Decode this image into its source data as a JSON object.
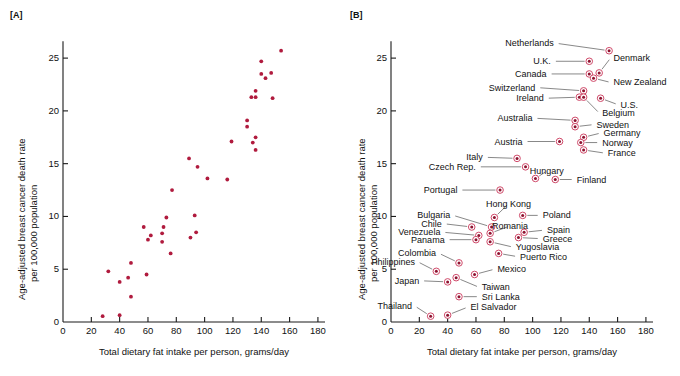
{
  "figure": {
    "background": "#ffffff",
    "marker_color": "#b01b3e",
    "ring_color": "#d04a6a",
    "leader_color": "#555555"
  },
  "panels": [
    {
      "tag": "[A]",
      "id": "panel-a",
      "xlabel": "Total dietary fat intake per person, grams/day",
      "ylabel_line1": "Age-adjusted breast cancer death rate",
      "ylabel_line2": "per 100,000 population",
      "xticks": [
        "0",
        "20",
        "40",
        "60",
        "80",
        "100",
        "120",
        "140",
        "160",
        "180"
      ],
      "yticks": [
        "0",
        "5",
        "10",
        "15",
        "20",
        "25"
      ]
    },
    {
      "tag": "[B]",
      "id": "panel-b",
      "xlabel": "Total dietary fat intake per person, grams/day",
      "ylabel_line1": "Age-adjusted breast cancer death rate",
      "ylabel_line2": "per 100,000 population",
      "xticks": [
        "0",
        "20",
        "40",
        "60",
        "80",
        "100",
        "120",
        "140",
        "160",
        "180"
      ],
      "yticks": [
        "0",
        "5",
        "10",
        "15",
        "20",
        "25"
      ]
    }
  ],
  "chart_data": {
    "type": "scatter",
    "title": "",
    "subtitle": "",
    "xlabel": "Total dietary fat intake per person, grams/day",
    "ylabel": "Age-adjusted breast cancer death rate per 100,000 population",
    "xlim": [
      0,
      185
    ],
    "ylim": [
      0,
      27
    ],
    "xticks": [
      0,
      20,
      40,
      60,
      80,
      100,
      120,
      140,
      160,
      180
    ],
    "yticks": [
      0,
      5,
      10,
      15,
      20,
      25
    ],
    "grid": false,
    "legend": "none",
    "panel_a_note": "Same data as panel B, plotted without country labels",
    "panel_b_note": "Same data as panel A, with country name labels and leader lines",
    "points": [
      {
        "label": "Netherlands",
        "x": 154,
        "y": 25.7,
        "lx": 117,
        "ly": 26.4,
        "anchor": "right"
      },
      {
        "label": "Denmark",
        "x": 147,
        "y": 23.6,
        "lx": 155,
        "ly": 25.0,
        "anchor": "left"
      },
      {
        "label": "U.K.",
        "x": 140,
        "y": 24.7,
        "lx": 115,
        "ly": 24.7,
        "anchor": "right"
      },
      {
        "label": "Canada",
        "x": 140,
        "y": 23.5,
        "lx": 112,
        "ly": 23.5,
        "anchor": "right"
      },
      {
        "label": "New Zealand",
        "x": 143,
        "y": 23.1,
        "lx": 155,
        "ly": 22.7,
        "anchor": "left"
      },
      {
        "label": "Switzerland",
        "x": 136,
        "y": 21.9,
        "lx": 104,
        "ly": 22.2,
        "anchor": "right"
      },
      {
        "label": "Ireland",
        "x": 133,
        "y": 21.3,
        "lx": 110,
        "ly": 21.2,
        "anchor": "right"
      },
      {
        "label": "U.S.",
        "x": 148,
        "y": 21.2,
        "lx": 160,
        "ly": 20.6,
        "anchor": "left"
      },
      {
        "label": "Belgium",
        "x": 136,
        "y": 21.3,
        "lx": 147,
        "ly": 19.8,
        "anchor": "left"
      },
      {
        "label": "Australia",
        "x": 130,
        "y": 19.1,
        "lx": 102,
        "ly": 19.3,
        "anchor": "right"
      },
      {
        "label": "Sweden",
        "x": 130,
        "y": 18.5,
        "lx": 143,
        "ly": 18.7,
        "anchor": "left"
      },
      {
        "label": "Germany",
        "x": 136,
        "y": 17.5,
        "lx": 148,
        "ly": 17.9,
        "anchor": "left"
      },
      {
        "label": "Norway",
        "x": 134,
        "y": 17.0,
        "lx": 147,
        "ly": 17.0,
        "anchor": "left"
      },
      {
        "label": "Austria",
        "x": 119,
        "y": 17.1,
        "lx": 95,
        "ly": 17.1,
        "anchor": "right"
      },
      {
        "label": "France",
        "x": 136,
        "y": 16.3,
        "lx": 151,
        "ly": 16.0,
        "anchor": "left"
      },
      {
        "label": "Italy",
        "x": 89,
        "y": 15.5,
        "lx": 67,
        "ly": 15.6,
        "anchor": "right"
      },
      {
        "label": "Czech Rep.",
        "x": 95,
        "y": 14.7,
        "lx": 62,
        "ly": 14.7,
        "anchor": "right"
      },
      {
        "label": "Hungary",
        "x": 102,
        "y": 13.6,
        "lx": 110,
        "ly": 14.3,
        "anchor": "center"
      },
      {
        "label": "Finland",
        "x": 116,
        "y": 13.5,
        "lx": 129,
        "ly": 13.5,
        "anchor": "left"
      },
      {
        "label": "Portugal",
        "x": 77,
        "y": 12.5,
        "lx": 49,
        "ly": 12.5,
        "anchor": "right"
      },
      {
        "label": "Hong Kong",
        "x": 73,
        "y": 9.9,
        "lx": 83,
        "ly": 11.2,
        "anchor": "center"
      },
      {
        "label": "Poland",
        "x": 93,
        "y": 10.1,
        "lx": 105,
        "ly": 10.1,
        "anchor": "left"
      },
      {
        "label": "Bulgaria",
        "x": 71,
        "y": 9.0,
        "lx": 44,
        "ly": 10.1,
        "anchor": "right"
      },
      {
        "label": "Chile",
        "x": 57,
        "y": 9.0,
        "lx": 38,
        "ly": 9.3,
        "anchor": "right"
      },
      {
        "label": "Romania",
        "x": 70,
        "y": 8.4,
        "lx": 84,
        "ly": 9.1,
        "anchor": "center"
      },
      {
        "label": "Spain",
        "x": 94,
        "y": 8.5,
        "lx": 108,
        "ly": 8.7,
        "anchor": "left"
      },
      {
        "label": "Venezuela",
        "x": 62,
        "y": 8.2,
        "lx": 37,
        "ly": 8.5,
        "anchor": "right"
      },
      {
        "label": "Greece",
        "x": 90,
        "y": 8.0,
        "lx": 105,
        "ly": 7.9,
        "anchor": "left"
      },
      {
        "label": "Panama",
        "x": 60,
        "y": 7.8,
        "lx": 40,
        "ly": 7.8,
        "anchor": "right"
      },
      {
        "label": "Yugoslavia",
        "x": 70,
        "y": 7.6,
        "lx": 86,
        "ly": 7.1,
        "anchor": "left"
      },
      {
        "label": "Colombia",
        "x": 48,
        "y": 5.6,
        "lx": 34,
        "ly": 6.5,
        "anchor": "right"
      },
      {
        "label": "Puerto Rico",
        "x": 76,
        "y": 6.5,
        "lx": 89,
        "ly": 6.2,
        "anchor": "left"
      },
      {
        "label": "Philippines",
        "x": 32,
        "y": 4.8,
        "lx": 19,
        "ly": 5.7,
        "anchor": "right"
      },
      {
        "label": "Mexico",
        "x": 59,
        "y": 4.5,
        "lx": 73,
        "ly": 5.0,
        "anchor": "left"
      },
      {
        "label": "Japan",
        "x": 40,
        "y": 3.8,
        "lx": 22,
        "ly": 3.9,
        "anchor": "right"
      },
      {
        "label": "Taiwan",
        "x": 46,
        "y": 4.2,
        "lx": 62,
        "ly": 3.3,
        "anchor": "left"
      },
      {
        "label": "Sri Lanka",
        "x": 48,
        "y": 2.4,
        "lx": 62,
        "ly": 2.4,
        "anchor": "left"
      },
      {
        "label": "Thailand",
        "x": 28,
        "y": 0.55,
        "lx": 17,
        "ly": 1.5,
        "anchor": "right"
      },
      {
        "label": "El Salvador",
        "x": 40,
        "y": 0.65,
        "lx": 54,
        "ly": 1.4,
        "anchor": "left"
      }
    ]
  }
}
